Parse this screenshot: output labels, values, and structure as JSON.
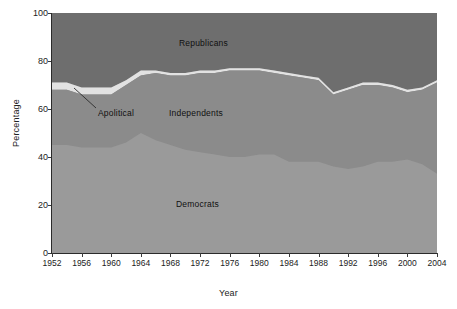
{
  "chart_data": {
    "type": "area",
    "title": "",
    "xlabel": "Year",
    "ylabel": "Percentage",
    "xlim": [
      1952,
      2004
    ],
    "ylim": [
      0,
      100
    ],
    "grid": false,
    "stacked": true,
    "legend_position": "inline-annotations",
    "x": [
      1952,
      1954,
      1956,
      1958,
      1960,
      1962,
      1964,
      1966,
      1968,
      1970,
      1972,
      1974,
      1976,
      1978,
      1980,
      1982,
      1984,
      1986,
      1988,
      1990,
      1992,
      1994,
      1996,
      1998,
      2000,
      2002,
      2004
    ],
    "xticks": [
      1952,
      1956,
      1960,
      1964,
      1968,
      1972,
      1976,
      1980,
      1984,
      1988,
      1992,
      1996,
      2000,
      2004
    ],
    "yticks": [
      0,
      20,
      40,
      60,
      80,
      100
    ],
    "series": [
      {
        "name": "Democrats",
        "color": "#9a9a9a",
        "values": [
          45,
          45,
          44,
          44,
          44,
          46,
          50,
          47,
          45,
          43,
          42,
          41,
          40,
          40,
          41,
          41,
          38,
          38,
          38,
          36,
          35,
          36,
          38,
          38,
          39,
          37,
          33
        ]
      },
      {
        "name": "Independents",
        "color": "#8b8b8b",
        "values": [
          23,
          23,
          22,
          22,
          22,
          24,
          24,
          28,
          29,
          31,
          33,
          34,
          36,
          36,
          35,
          34,
          36,
          35,
          34,
          30,
          33,
          34,
          32,
          31,
          28,
          31,
          38
        ]
      },
      {
        "name": "Apolitical",
        "color": "#e2e2e2",
        "values": [
          3,
          3,
          3,
          3,
          3,
          2,
          2,
          1,
          1,
          1,
          1,
          1,
          1,
          1,
          1,
          1,
          1,
          1,
          1,
          1,
          1,
          1,
          1,
          1,
          1,
          1,
          1
        ]
      },
      {
        "name": "Republicans",
        "color": "#6e6e6e",
        "values": [
          29,
          29,
          31,
          31,
          31,
          28,
          24,
          24,
          25,
          25,
          24,
          24,
          23,
          23,
          23,
          24,
          25,
          26,
          27,
          33,
          31,
          29,
          29,
          30,
          32,
          31,
          28
        ]
      }
    ],
    "cumulative_top_of_independents": [
      71,
      71,
      70,
      69,
      69,
      72,
      75,
      75,
      75,
      75,
      76,
      76,
      77,
      77,
      77,
      76,
      75,
      74,
      73,
      67,
      69,
      71,
      71,
      70,
      68,
      69,
      71
    ],
    "cumulative_top_of_apolitical": [
      71.5,
      71.5,
      70.5,
      70,
      70,
      74,
      75,
      75.5,
      75.5,
      76,
      76.5,
      77,
      77.5,
      77.5,
      77.5,
      76.5,
      75.5,
      74.5,
      73.5,
      67.5,
      69.5,
      71.5,
      71.5,
      70.5,
      68.5,
      69.5,
      72
    ],
    "annotations": [
      {
        "name": "Republicans",
        "text": "Republicans"
      },
      {
        "name": "Independents",
        "text": "Independents"
      },
      {
        "name": "Democrats",
        "text": "Democrats"
      },
      {
        "name": "Apolitical",
        "text": "Apolitical"
      }
    ]
  },
  "axes": {
    "y_title": "Percentage",
    "x_title": "Year",
    "y_tick_labels": [
      "0",
      "20",
      "40",
      "60",
      "80",
      "100"
    ],
    "x_tick_labels": [
      "1952",
      "1956",
      "1960",
      "1964",
      "1968",
      "1972",
      "1976",
      "1980",
      "1984",
      "1988",
      "1992",
      "1996",
      "2000",
      "2004"
    ]
  },
  "labels": {
    "republicans": "Republicans",
    "independents": "Independents",
    "democrats": "Democrats",
    "apolitical": "Apolitical"
  },
  "colors": {
    "republicans": "#6e6e6e",
    "independents": "#8b8b8b",
    "apolitical": "#e2e2e2",
    "democrats": "#9a9a9a",
    "axis": "#2b2b2b",
    "background": "#ffffff",
    "text": "#1a1a1a"
  }
}
